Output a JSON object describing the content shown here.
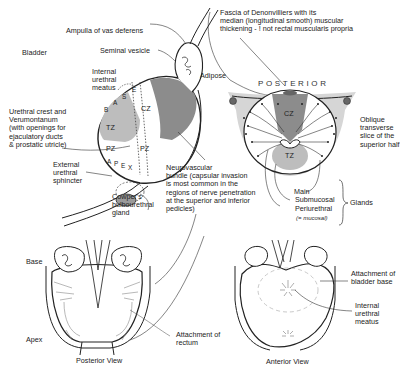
{
  "labels": {
    "ampulla": "Ampulla of vas deferens",
    "seminal_vesicle": "Seminal vesicle",
    "bladder": "Bladder",
    "internal_meatus": "Internal\nurethral\nmeatus",
    "urethral_crest": "Urethral crest and\nVerumontanum\n(with openings for\nejaculatory ducts\n& prostatic utricle)",
    "external_sphincter": "External\nurethral\nsphincter",
    "cowpers": "Cowper's\nbulbourethral\ngland",
    "neurovascular": "Neurovascular\nbundle (capsular invasion\nis most common in the\nregions of nerve penetration\nat the superior and inferior\npedicles)",
    "fascia": "Fascia of Denonvilliers with its\nmedian (longitudinal smooth) muscular\nthickening - ! not rectal muscularis propria",
    "adipose": "Adipose",
    "posterior": "POSTERIOR",
    "oblique": "Oblique\ntransverse\nslice of the\nsuperior half",
    "glands_main": "Main",
    "glands_submucosal": "Submucosal",
    "glands_periurethral": "Periurethral",
    "glands_mucosal": "(= mucosal)",
    "glands": "Glands",
    "base": "Base",
    "apex": "Apex",
    "attachment_rectum": "Attachment of\nrectum",
    "attachment_bladder": "Attachment of\nbladder base",
    "internal_meatus_2": "Internal\nurethral\nmeatus",
    "posterior_view": "Posterior View",
    "anterior_view": "Anterior View"
  },
  "zones": {
    "cz": "CZ",
    "tz": "TZ",
    "pz": "PZ",
    "base_letters": [
      "B",
      "A",
      "S",
      "E"
    ],
    "apex_letters": [
      "A",
      "P",
      "E",
      "X"
    ]
  },
  "colors": {
    "dark_zone": "#8c8c8c",
    "light_zone": "#bdbdbd",
    "line": "#222222",
    "gland_fill": "#9a9a9a"
  }
}
